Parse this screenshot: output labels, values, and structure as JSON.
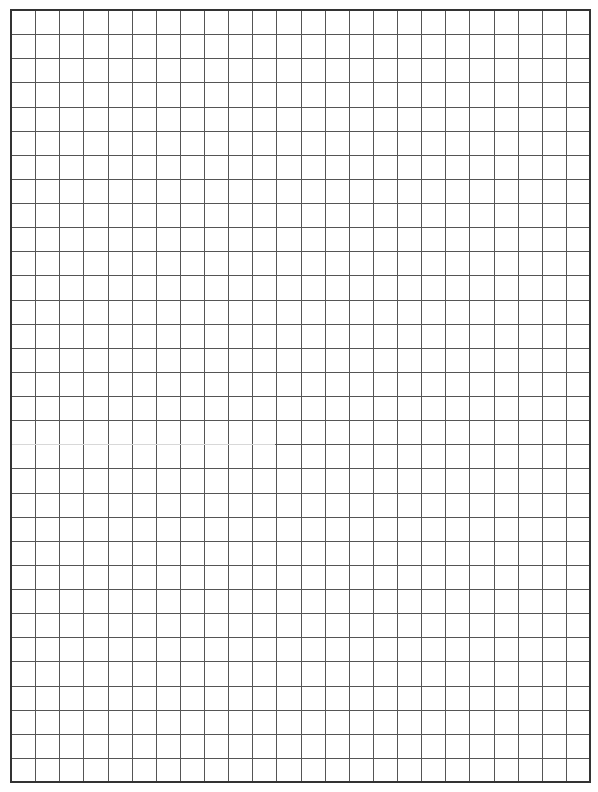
{
  "page": {
    "type": "graph-paper",
    "background": "#ffffff"
  },
  "grid": {
    "left": 11,
    "top": 10,
    "right": 590,
    "bottom": 782,
    "columns": 24,
    "rows": 32,
    "line_color": "#555555",
    "border_color": "#333333",
    "line_width": 1,
    "border_width": 2,
    "faint_segment": {
      "row_line": 18,
      "x_start": 11,
      "x_end": 275,
      "color": "#d8d8d8"
    }
  }
}
